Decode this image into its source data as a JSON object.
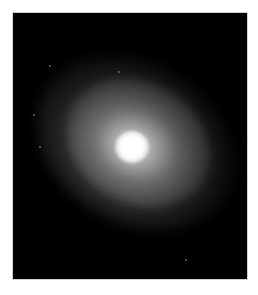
{
  "image": {
    "subject": "elliptical galaxy",
    "background_color": "#000000",
    "frame_border_color": "#cfcfcf",
    "core_color": "#ffffff",
    "stars": [
      {
        "x": 48,
        "y": 64
      },
      {
        "x": 117,
        "y": 70
      },
      {
        "x": 32,
        "y": 113
      },
      {
        "x": 38,
        "y": 145
      },
      {
        "x": 184,
        "y": 258
      }
    ]
  }
}
